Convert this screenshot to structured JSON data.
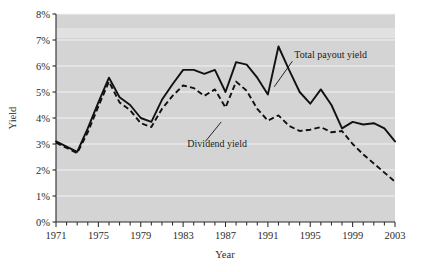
{
  "chart_data": {
    "type": "line",
    "title": "",
    "xlabel": "Year",
    "ylabel": "Yield",
    "xlim": [
      1971,
      2003
    ],
    "ylim": [
      0,
      8
    ],
    "grid": true,
    "grid_axis": "y",
    "legend_position": "inline-annotations",
    "plot_background": "#d4d4d4",
    "x_tick_labels": [
      "1971",
      "1975",
      "1979",
      "1983",
      "1987",
      "1991",
      "1995",
      "1999",
      "2003"
    ],
    "x_tick_values": [
      1971,
      1975,
      1979,
      1983,
      1987,
      1991,
      1995,
      1999,
      2003
    ],
    "x_minor_tick_interval": 1,
    "y_tick_labels": [
      "0%",
      "1%",
      "2%",
      "3%",
      "4%",
      "5%",
      "6%",
      "7%",
      "8%"
    ],
    "y_tick_values": [
      0,
      1,
      2,
      3,
      4,
      5,
      6,
      7,
      8
    ],
    "x": [
      1971,
      1972,
      1973,
      1974,
      1975,
      1976,
      1977,
      1978,
      1979,
      1980,
      1981,
      1982,
      1983,
      1984,
      1985,
      1986,
      1987,
      1988,
      1989,
      1990,
      1991,
      1992,
      1993,
      1994,
      1995,
      1996,
      1997,
      1998,
      1999,
      2000,
      2001,
      2002,
      2003
    ],
    "series": [
      {
        "name": "Total payout yield",
        "style": "solid",
        "color": "#111111",
        "values": [
          3.1,
          2.9,
          2.7,
          3.6,
          4.6,
          5.55,
          4.8,
          4.5,
          4.0,
          3.85,
          4.7,
          5.3,
          5.85,
          5.85,
          5.7,
          5.85,
          5.0,
          6.15,
          6.05,
          5.55,
          4.9,
          6.75,
          5.85,
          5.0,
          4.55,
          5.1,
          4.5,
          3.6,
          3.85,
          3.75,
          3.8,
          3.6,
          3.1
        ],
        "annotation": {
          "text": "Total payout yield",
          "x": 1993.5,
          "y": 6.3,
          "leader_to_x": 1991.6,
          "leader_to_y": 5.2
        }
      },
      {
        "name": "Dividend yield",
        "style": "dashed",
        "color": "#111111",
        "values": [
          3.05,
          2.85,
          2.65,
          3.45,
          4.45,
          5.4,
          4.6,
          4.3,
          3.8,
          3.65,
          4.35,
          4.85,
          5.25,
          5.15,
          4.85,
          5.1,
          4.4,
          5.4,
          5.05,
          4.35,
          3.9,
          4.1,
          3.7,
          3.5,
          3.55,
          3.65,
          3.45,
          3.5,
          3.0,
          2.6,
          2.25,
          1.9,
          1.55
        ],
        "annotation": {
          "text": "Dividend yield",
          "x": 1983.4,
          "y": 2.9,
          "leader_to_x": 1986.6,
          "leader_to_y": 3.85
        }
      }
    ]
  },
  "chart_annotations": {
    "total_payout_label": "Total payout yield",
    "dividend_label": "Dividend yield"
  },
  "axes": {
    "y_title": "Yield",
    "x_title": "Year"
  }
}
